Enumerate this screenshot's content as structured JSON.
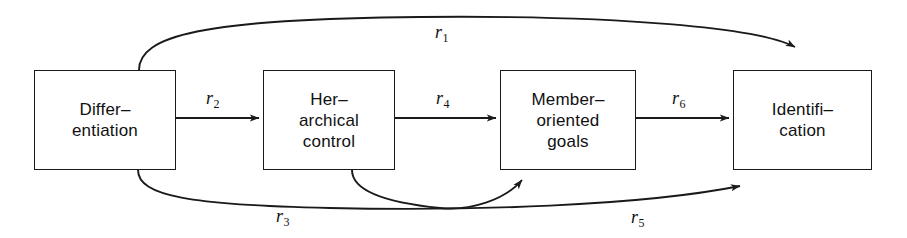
{
  "figure": {
    "type": "path-diagram",
    "title": "",
    "background_color": "#ffffff",
    "stroke_color": "#1a1a1a",
    "text_color": "#111111"
  },
  "nodes": [
    {
      "id": "differentiation",
      "lines": [
        "Differ–",
        "entiation"
      ],
      "line1": "Differ–",
      "line2": "entiation",
      "line3": "",
      "x": 34,
      "y": 70,
      "w": 142,
      "h": 100
    },
    {
      "id": "hierarchical-control",
      "lines": [
        "Her–",
        "archical",
        "control"
      ],
      "line1": "Her–",
      "line2": "archical",
      "line3": "control",
      "x": 263,
      "y": 70,
      "w": 132,
      "h": 100
    },
    {
      "id": "member-oriented-goals",
      "lines": [
        "Member–",
        "oriented",
        "goals"
      ],
      "line1": "Member–",
      "line2": "oriented",
      "line3": "goals",
      "x": 500,
      "y": 70,
      "w": 136,
      "h": 100
    },
    {
      "id": "identification",
      "lines": [
        "Identifi–",
        "cation"
      ],
      "line1": "Identifi–",
      "line2": "cation",
      "line3": "",
      "x": 733,
      "y": 70,
      "w": 139,
      "h": 100
    }
  ],
  "edges": [
    {
      "id": "r1",
      "label": "r",
      "subscript": "1",
      "from": "differentiation",
      "to": "identification",
      "shape": "arc-above",
      "label_x": 435,
      "label_y": 22
    },
    {
      "id": "r2",
      "label": "r",
      "subscript": "2",
      "from": "differentiation",
      "to": "hierarchical-control",
      "shape": "straight",
      "label_x": 206,
      "label_y": 88
    },
    {
      "id": "r3",
      "label": "r",
      "subscript": "3",
      "from": "differentiation",
      "to": "member-oriented-goals",
      "shape": "arc-below",
      "label_x": 276,
      "label_y": 206
    },
    {
      "id": "r4",
      "label": "r",
      "subscript": "4",
      "from": "hierarchical-control",
      "to": "member-oriented-goals",
      "shape": "straight",
      "label_x": 436,
      "label_y": 88
    },
    {
      "id": "r5",
      "label": "r",
      "subscript": "5",
      "from": "hierarchical-control",
      "to": "identification",
      "shape": "arc-below",
      "label_x": 631,
      "label_y": 207
    },
    {
      "id": "r6",
      "label": "r",
      "subscript": "6",
      "from": "member-oriented-goals",
      "to": "identification",
      "shape": "straight",
      "label_x": 672,
      "label_y": 88
    }
  ]
}
